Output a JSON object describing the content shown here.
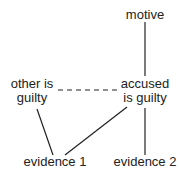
{
  "nodes": {
    "motive": {
      "label": "motive"
    },
    "other": {
      "line1": "other is",
      "line2": "guilty"
    },
    "accused": {
      "line1": "accused",
      "line2": "is guilty"
    },
    "evidence1": {
      "label": "evidence 1"
    },
    "evidence2": {
      "label": "evidence 2"
    }
  },
  "edges": [
    {
      "from": "motive",
      "to": "accused",
      "style": "solid"
    },
    {
      "from": "other",
      "to": "accused",
      "style": "dashed"
    },
    {
      "from": "other",
      "to": "evidence1",
      "style": "solid"
    },
    {
      "from": "accused",
      "to": "evidence1",
      "style": "solid"
    },
    {
      "from": "accused",
      "to": "evidence2",
      "style": "solid"
    }
  ],
  "colors": {
    "line": "#222222",
    "text": "#222222",
    "background": "#ffffff"
  }
}
